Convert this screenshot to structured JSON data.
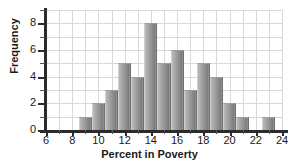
{
  "chart_data": {
    "type": "bar",
    "title": "",
    "xlabel": "Percent in Poverty",
    "ylabel": "Frequency",
    "xlim": [
      6,
      24
    ],
    "ylim": [
      0,
      9
    ],
    "grid": true,
    "legend": "none",
    "bin_width": 1,
    "bin_starts": [
      8.5,
      9.5,
      10.5,
      11.5,
      12.5,
      13.5,
      14.5,
      15.5,
      16.5,
      17.5,
      18.5,
      19.5,
      20.5,
      21.5,
      22.5
    ],
    "categories": [
      "8.5-9.5",
      "9.5-10.5",
      "10.5-11.5",
      "11.5-12.5",
      "12.5-13.5",
      "13.5-14.5",
      "14.5-15.5",
      "15.5-16.5",
      "16.5-17.5",
      "17.5-18.5",
      "18.5-19.5",
      "19.5-20.5",
      "20.5-21.5",
      "21.5-22.5",
      "22.5-23.5"
    ],
    "values": [
      1,
      2,
      3,
      5,
      4,
      8,
      5,
      6,
      3,
      5,
      4,
      2,
      1,
      0,
      1
    ],
    "x_ticks_major": [
      6,
      8,
      10,
      12,
      14,
      16,
      18,
      20,
      22,
      24
    ],
    "x_ticks_minor": [
      7,
      9,
      11,
      13,
      15,
      17,
      19,
      21,
      23
    ],
    "y_ticks_major": [
      0,
      2,
      4,
      6,
      8
    ],
    "y_ticks_minor": [
      1,
      3,
      5,
      7,
      9
    ],
    "x_tick_labels": [
      "6",
      "8",
      "10",
      "12",
      "14",
      "16",
      "18",
      "20",
      "22",
      "24"
    ],
    "y_tick_labels": [
      "0",
      "2",
      "4",
      "6",
      "8"
    ],
    "colors": {
      "bar_light": "#b9b9b9",
      "bar_dark": "#7c7c7c",
      "axis": "#2b2b2b",
      "grid": "#d8d8d8",
      "text": "#1a1a1a",
      "background": "#ffffff"
    }
  }
}
